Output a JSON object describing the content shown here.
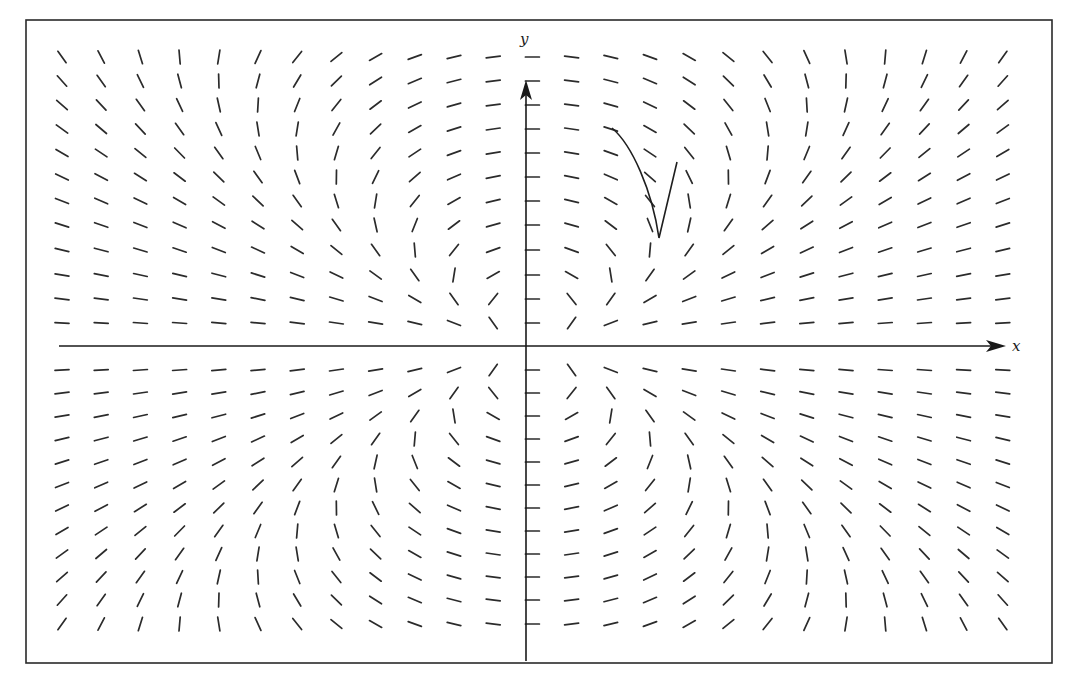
{
  "figure": {
    "type": "slope_field",
    "canvas": {
      "width": 1076,
      "height": 674,
      "background": "#ffffff"
    },
    "frame": {
      "x": 26,
      "y": 20,
      "width": 1026,
      "height": 643,
      "color": "#2a2a2a"
    },
    "axes": {
      "x_label": "x",
      "y_label": "y",
      "origin_px": {
        "x": 526,
        "y": 346
      },
      "x_axis": {
        "from_x": 59,
        "to_x": 1006,
        "label_pos": {
          "x": 1012,
          "y": 351
        }
      },
      "y_axis": {
        "from_y": 661,
        "to_y": 80,
        "label_pos": {
          "x": 520,
          "y": 44
        }
      },
      "color": "#1a1a1a"
    },
    "solution_curve": {
      "description": "solution curve with cusp",
      "path": "M612,128 C632,145 652,190 659,238 L677,162",
      "color": "#1f1f1f"
    }
  },
  "chart_data": {
    "type": "slope_field",
    "title": "",
    "xlabel": "x",
    "ylabel": "y",
    "grid": {
      "columns": 25,
      "rows_above_axis": 12,
      "rows_below_axis": 12,
      "col_x0_px": 62,
      "col_dx_px": 39.2,
      "axis_col_index": 12,
      "rows_above_y_px": [
        57,
        81,
        105,
        129,
        153,
        177,
        201,
        225,
        250,
        275,
        299,
        323
      ],
      "rows_below_y_px": [
        370,
        393,
        416,
        439,
        462,
        485,
        508,
        531,
        554,
        577,
        600,
        624
      ],
      "segment_length_px": 14
    },
    "model": {
      "formula": "dy/dx = -k*X*Y / (Y^2 - (X/c)^2), X=(col-12)/12, Y=signed row distance (0..1)",
      "k": 1.3,
      "c": 0.72,
      "notes": [
        "horizontal segments along the y-axis column",
        "vertical-slope loci along |X| = c*|Y| (V shapes above and below x-axis)",
        "field antisymmetric across x-axis"
      ]
    },
    "regions": [
      {
        "where": "upper-left outside V",
        "slope_sign": "negative"
      },
      {
        "where": "upper-left inside V",
        "slope_sign": "positive"
      },
      {
        "where": "upper-right inside V",
        "slope_sign": "negative"
      },
      {
        "where": "upper-right outside V",
        "slope_sign": "positive"
      },
      {
        "where": "lower-left outside V",
        "slope_sign": "positive"
      },
      {
        "where": "lower-left inside V",
        "slope_sign": "negative"
      },
      {
        "where": "lower-right inside V",
        "slope_sign": "positive"
      },
      {
        "where": "lower-right outside V",
        "slope_sign": "negative"
      },
      {
        "where": "on y-axis",
        "slope_sign": "zero"
      }
    ]
  }
}
